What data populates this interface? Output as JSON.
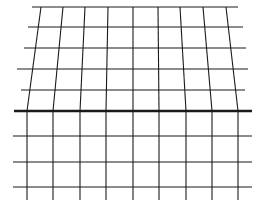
{
  "diagram": {
    "type": "perspective-grid",
    "background": "#ffffff",
    "line_color": "#1a1a1a",
    "upper_horizontals": [
      {
        "y": 7,
        "x1": 32,
        "x2": 238
      },
      {
        "y": 27,
        "x1": 28,
        "x2": 243
      },
      {
        "y": 48,
        "x1": 24,
        "x2": 246
      },
      {
        "y": 69,
        "x1": 17,
        "x2": 248
      },
      {
        "y": 90,
        "x1": 21,
        "x2": 245
      }
    ],
    "horizon": {
      "y": 111,
      "x1": 14,
      "x2": 252,
      "width": 2.5
    },
    "lower_horizontals": [
      {
        "y": 136,
        "x1": 13,
        "x2": 252
      },
      {
        "y": 162,
        "x1": 13,
        "x2": 252
      },
      {
        "y": 187,
        "x1": 13,
        "x2": 252
      }
    ],
    "verticals": [
      {
        "top_x": 41,
        "bottom_x": 27
      },
      {
        "top_x": 63,
        "bottom_x": 53
      },
      {
        "top_x": 85,
        "bottom_x": 80
      },
      {
        "top_x": 108,
        "bottom_x": 106
      },
      {
        "top_x": 133,
        "bottom_x": 133
      },
      {
        "top_x": 158,
        "bottom_x": 159
      },
      {
        "top_x": 180,
        "bottom_x": 186
      },
      {
        "top_x": 203,
        "bottom_x": 212
      },
      {
        "top_x": 226,
        "bottom_x": 238
      }
    ],
    "vertical_top_y": 7,
    "vertical_horizon_y": 111,
    "vertical_bottom_y": 200
  }
}
